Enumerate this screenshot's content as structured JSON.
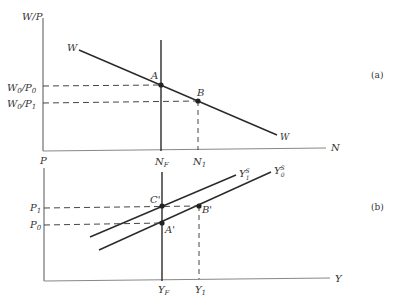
{
  "panel_a": {
    "tag": "(a)",
    "y_axis_label": "W/P",
    "x_axis_label": "N",
    "curve_label_start": "W",
    "curve_label_end": "W",
    "point_A": "A",
    "point_B": "B",
    "y_tick_high": "W",
    "y_tick_high_sub0": "0",
    "y_tick_high_mid": "/P",
    "y_tick_high_sub1": "0",
    "y_tick_low": "W",
    "y_tick_low_sub0": "0",
    "y_tick_low_mid": "/P",
    "y_tick_low_sub1": "1",
    "x_tick_NF": "N",
    "x_tick_NF_sub": "F",
    "x_tick_N1": "N",
    "x_tick_N1_sub": "1"
  },
  "panel_b": {
    "tag": "(b)",
    "y_axis_label": "P",
    "x_axis_label": "Y",
    "vertical_label": "N",
    "vertical_label_sub": "F",
    "vertical_label2": "N",
    "vertical_label2_sub": "1",
    "point_C": "C'",
    "point_A": "A'",
    "point_B": "B'",
    "y_tick_P1": "P",
    "y_tick_P1_sub": "1",
    "y_tick_P0": "P",
    "y_tick_P0_sub": "0",
    "curve_1": "Y",
    "curve_1_sup": "S",
    "curve_1_sub": "1",
    "curve_0": "Y",
    "curve_0_sup": "S",
    "curve_0_sub": "0",
    "x_tick_YF": "Y",
    "x_tick_YF_sub": "F",
    "x_tick_Y1": "Y",
    "x_tick_Y1_sub": "1"
  },
  "colors": {
    "line": "#2a2a2a",
    "axis": "#555555",
    "text": "#333333"
  }
}
